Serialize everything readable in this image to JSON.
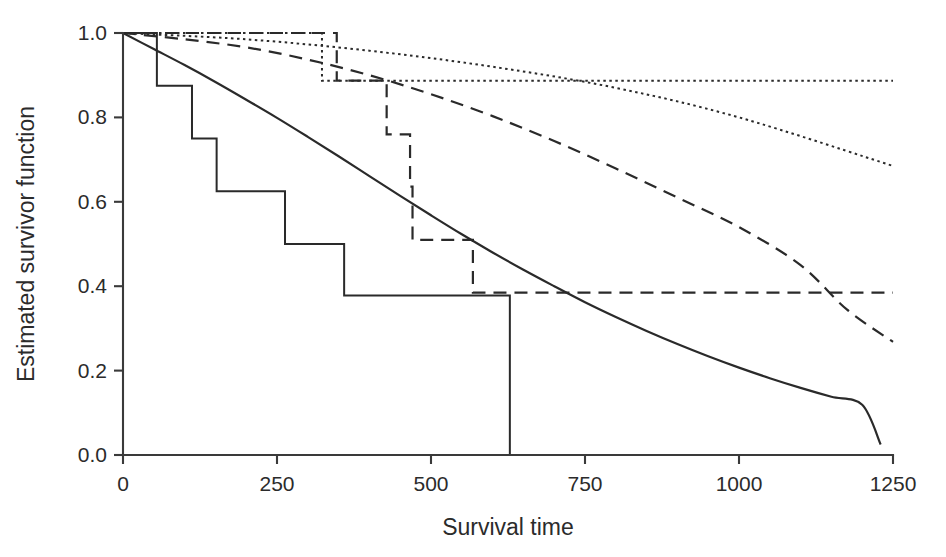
{
  "chart_data": {
    "type": "line",
    "title": "",
    "xlabel": "Survival time",
    "ylabel": "Estimated survivor function",
    "xlim": [
      0,
      1250
    ],
    "ylim": [
      0.0,
      1.0
    ],
    "xticks": [
      0,
      250,
      500,
      750,
      1000,
      1250
    ],
    "xticklabels": [
      "0",
      "250",
      "500",
      "750",
      "1000",
      "1250"
    ],
    "yticks": [
      0.0,
      0.2,
      0.4,
      0.6,
      0.8,
      1.0
    ],
    "yticklabels": [
      "0.0",
      "0.2",
      "0.4",
      "0.6",
      "0.8",
      "1.0"
    ],
    "grid": false,
    "legend": "none",
    "series": [
      {
        "name": "Kaplan-Meier group 1 (solid step)",
        "style": "solid-step",
        "linestyle": "solid",
        "stroke_width": 2.0,
        "points": [
          [
            0,
            1.0
          ],
          [
            55,
            1.0
          ],
          [
            55,
            0.875
          ],
          [
            112,
            0.875
          ],
          [
            112,
            0.75
          ],
          [
            152,
            0.75
          ],
          [
            152,
            0.625
          ],
          [
            263,
            0.625
          ],
          [
            263,
            0.5
          ],
          [
            359,
            0.5
          ],
          [
            359,
            0.378
          ],
          [
            628,
            0.378
          ],
          [
            628,
            0.0
          ]
        ]
      },
      {
        "name": "Parametric fit group 1 (solid smooth)",
        "style": "smooth",
        "linestyle": "solid",
        "stroke_width": 2.2,
        "points": [
          [
            0,
            1.0
          ],
          [
            50,
            0.962
          ],
          [
            100,
            0.924
          ],
          [
            150,
            0.884
          ],
          [
            200,
            0.842
          ],
          [
            250,
            0.799
          ],
          [
            300,
            0.754
          ],
          [
            350,
            0.708
          ],
          [
            400,
            0.661
          ],
          [
            450,
            0.614
          ],
          [
            500,
            0.568
          ],
          [
            550,
            0.523
          ],
          [
            600,
            0.48
          ],
          [
            650,
            0.439
          ],
          [
            700,
            0.4
          ],
          [
            750,
            0.362
          ],
          [
            800,
            0.327
          ],
          [
            850,
            0.294
          ],
          [
            900,
            0.263
          ],
          [
            950,
            0.234
          ],
          [
            1000,
            0.207
          ],
          [
            1050,
            0.182
          ],
          [
            1100,
            0.159
          ],
          [
            1150,
            0.138
          ],
          [
            1200,
            0.119
          ],
          [
            1230,
            0.025
          ]
        ]
      },
      {
        "name": "Kaplan-Meier group 2 (dashed step)",
        "style": "dashed-step",
        "linestyle": "dashed",
        "stroke_width": 2.2,
        "dasharray": "13,8",
        "points": [
          [
            0,
            1.0
          ],
          [
            347,
            1.0
          ],
          [
            347,
            0.887
          ],
          [
            428,
            0.887
          ],
          [
            428,
            0.76
          ],
          [
            466,
            0.76
          ],
          [
            466,
            0.636
          ],
          [
            470,
            0.636
          ],
          [
            470,
            0.51
          ],
          [
            568,
            0.51
          ],
          [
            568,
            0.385
          ],
          [
            1250,
            0.385
          ]
        ]
      },
      {
        "name": "Parametric fit group 2 (dashed smooth)",
        "style": "smooth",
        "linestyle": "dashed",
        "stroke_width": 2.2,
        "dasharray": "13,8",
        "points": [
          [
            0,
            1.0
          ],
          [
            100,
            0.985
          ],
          [
            200,
            0.966
          ],
          [
            300,
            0.937
          ],
          [
            400,
            0.9
          ],
          [
            500,
            0.855
          ],
          [
            600,
            0.803
          ],
          [
            700,
            0.744
          ],
          [
            800,
            0.679
          ],
          [
            900,
            0.61
          ],
          [
            1000,
            0.54
          ],
          [
            1100,
            0.45
          ],
          [
            1175,
            0.345
          ],
          [
            1250,
            0.268
          ]
        ]
      },
      {
        "name": "Kaplan-Meier group 3 (dotted step)",
        "style": "dotted-step",
        "linestyle": "dotted",
        "stroke_width": 2.0,
        "dasharray": "2.5,3.5",
        "points": [
          [
            0,
            1.0
          ],
          [
            323,
            1.0
          ],
          [
            323,
            0.887
          ],
          [
            1250,
            0.887
          ]
        ]
      },
      {
        "name": "Parametric fit group 3 (dotted smooth)",
        "style": "smooth",
        "linestyle": "dotted",
        "stroke_width": 2.0,
        "dasharray": "2.5,3.5",
        "points": [
          [
            0,
            1.0
          ],
          [
            200,
            0.985
          ],
          [
            400,
            0.958
          ],
          [
            600,
            0.92
          ],
          [
            800,
            0.87
          ],
          [
            1000,
            0.8
          ],
          [
            1250,
            0.685
          ]
        ]
      }
    ]
  },
  "axes": {
    "x_label": "Survival time",
    "y_label": "Estimated survivor function"
  }
}
